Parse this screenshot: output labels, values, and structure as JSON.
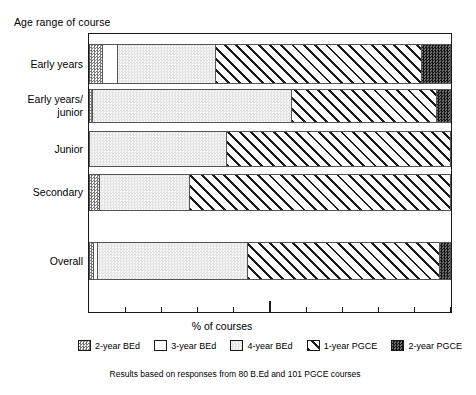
{
  "chart_data": {
    "type": "bar",
    "orientation": "horizontal",
    "stacked": true,
    "title": "Age range of course",
    "xlabel": "% of courses",
    "ylabel": "",
    "xlim": [
      0,
      100
    ],
    "xticks": [
      10,
      20,
      30,
      40,
      50,
      60,
      70,
      80,
      90,
      100
    ],
    "major_tick": 50,
    "grid": false,
    "legend_position": "bottom",
    "categories": [
      "Early years",
      "Early years/\njunior",
      "Junior",
      "Secondary",
      "Overall"
    ],
    "series": [
      {
        "name": "2-year BEd",
        "pattern": "checkered-light",
        "values": [
          4,
          1,
          0,
          3,
          1.5
        ]
      },
      {
        "name": "3-year BEd",
        "pattern": "white",
        "values": [
          4,
          0,
          0,
          0,
          1
        ]
      },
      {
        "name": "4-year BEd",
        "pattern": "light-gray",
        "values": [
          27,
          55,
          38,
          25,
          41.5
        ]
      },
      {
        "name": "1-year PGCE",
        "pattern": "diagonal-hatch",
        "values": [
          57,
          40,
          62,
          72,
          53
        ]
      },
      {
        "name": "2-year PGCE",
        "pattern": "checkered-dark",
        "values": [
          8,
          4,
          0,
          0,
          3
        ]
      }
    ],
    "annotation": "Results based on responses from 80 B.Ed and 101 PGCE courses"
  },
  "legend": {
    "items": [
      {
        "label": "2-year BEd",
        "swatch": "pat-2bed"
      },
      {
        "label": "3-year BEd",
        "swatch": "pat-3bed"
      },
      {
        "label": "4-year BEd",
        "swatch": "pat-4bed"
      },
      {
        "label": "1-year PGCE",
        "swatch": "pat-1pgce"
      },
      {
        "label": "2-year PGCE",
        "swatch": "pat-2pgce"
      }
    ]
  },
  "colors": {
    "frame": "#1a1a1a",
    "hatch": "#1a1a1a",
    "light_gray": "#f0f0f0",
    "dark": "#3a3a3a",
    "background": "#ffffff"
  },
  "bars": [
    {
      "category": "Early years",
      "top": 10,
      "height": 40,
      "segments": [
        {
          "series": "2-year BEd",
          "value": 4,
          "pattern": "pat-2bed"
        },
        {
          "series": "3-year BEd",
          "value": 4,
          "pattern": "pat-3bed"
        },
        {
          "series": "4-year BEd",
          "value": 27,
          "pattern": "pat-4bed"
        },
        {
          "series": "1-year PGCE",
          "value": 57,
          "pattern": "pat-1pgce"
        },
        {
          "series": "2-year PGCE",
          "value": 8,
          "pattern": "pat-2pgce"
        }
      ]
    },
    {
      "category": "Early years/\njunior",
      "top": 55,
      "height": 34,
      "segments": [
        {
          "series": "2-year BEd",
          "value": 1,
          "pattern": "pat-2bed"
        },
        {
          "series": "4-year BEd",
          "value": 55,
          "pattern": "pat-4bed"
        },
        {
          "series": "1-year PGCE",
          "value": 40,
          "pattern": "pat-1pgce"
        },
        {
          "series": "2-year PGCE",
          "value": 4,
          "pattern": "pat-2pgce"
        }
      ]
    },
    {
      "category": "Junior",
      "top": 97,
      "height": 36,
      "segments": [
        {
          "series": "4-year BEd",
          "value": 38,
          "pattern": "pat-4bed"
        },
        {
          "series": "1-year PGCE",
          "value": 62,
          "pattern": "pat-1pgce"
        }
      ]
    },
    {
      "category": "Secondary",
      "top": 140,
      "height": 37,
      "segments": [
        {
          "series": "2-year BEd",
          "value": 3,
          "pattern": "pat-2bed"
        },
        {
          "series": "4-year BEd",
          "value": 25,
          "pattern": "pat-4bed"
        },
        {
          "series": "1-year PGCE",
          "value": 72,
          "pattern": "pat-1pgce"
        }
      ]
    },
    {
      "category": "Overall",
      "top": 208,
      "height": 38,
      "segments": [
        {
          "series": "2-year BEd",
          "value": 1.5,
          "pattern": "pat-2bed"
        },
        {
          "series": "3-year BEd",
          "value": 1,
          "pattern": "pat-3bed"
        },
        {
          "series": "4-year BEd",
          "value": 41.5,
          "pattern": "pat-4bed"
        },
        {
          "series": "1-year PGCE",
          "value": 53,
          "pattern": "pat-1pgce"
        },
        {
          "series": "2-year PGCE",
          "value": 3,
          "pattern": "pat-2pgce"
        }
      ]
    }
  ]
}
